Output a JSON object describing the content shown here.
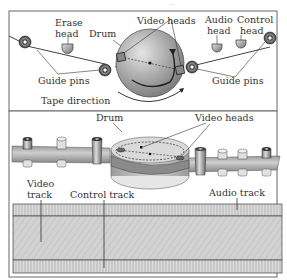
{
  "header_text": "...",
  "top_panel": {
    "labels": {
      "erase_head_1": "Erase",
      "erase_head_2": "head",
      "drum": "Drum",
      "video_heads": "Video heads",
      "audio_head_1": "Audio",
      "audio_head_2": "head",
      "control_head_1": "Control",
      "control_head_2": "head",
      "guide_pins_left": "Guide pins",
      "guide_pins_right": "Guide pins",
      "tape_direction": "Tape direction"
    }
  },
  "bottom_panel": {
    "labels": {
      "drum": "Drum",
      "video_heads": "Video heads",
      "video_track_1": "Video",
      "video_track_2": "track",
      "control_track": "Control track",
      "audio_track": "Audio track"
    }
  },
  "colors": {
    "frame": "#555555",
    "tape": "#b8b8b8",
    "drum": "#aaaaaa",
    "track_fill": "#d4d4d4"
  }
}
